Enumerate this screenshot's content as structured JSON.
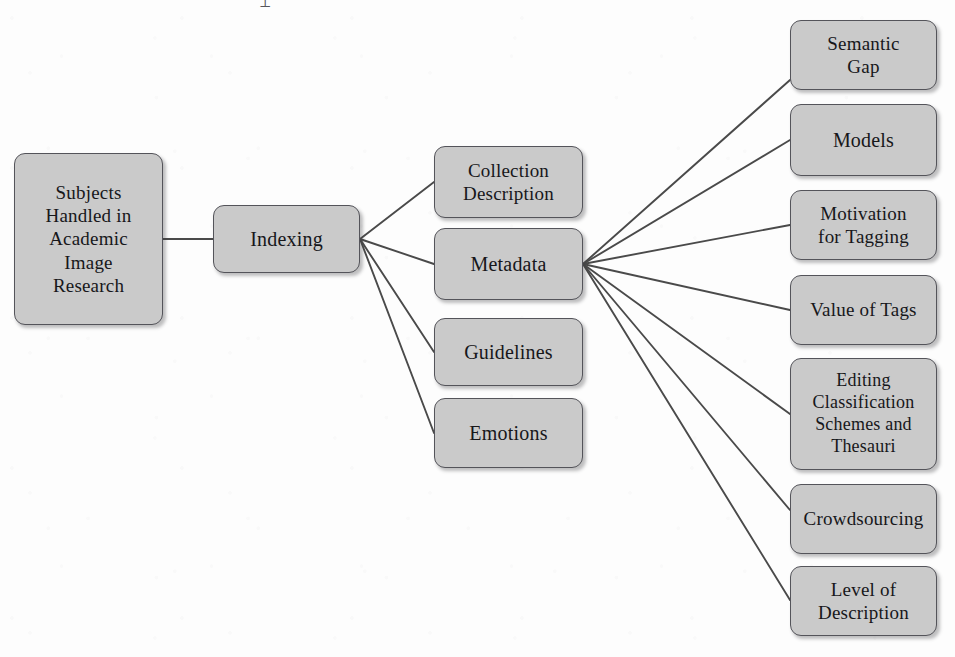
{
  "diagram": {
    "type": "tree-mindmap",
    "title": "Subjects Handled in Academic Image Research",
    "orientation": "left-to-right",
    "colors": {
      "node_fill": "#cacaca",
      "node_border": "#54545a",
      "edge": "#4a4a4a",
      "text": "#17171a",
      "background": "#fdfdfd"
    },
    "root": {
      "id": "root",
      "label": "Subjects\nHandled in\nAcademic\nImage\nResearch",
      "x": 14,
      "y": 153,
      "w": 149,
      "h": 172,
      "font_size": 19
    },
    "level1": [
      {
        "id": "indexing",
        "label": "Indexing",
        "x": 213,
        "y": 205,
        "w": 147,
        "h": 68,
        "font_size": 20
      }
    ],
    "level2": [
      {
        "id": "collection-description",
        "label": "Collection\nDescription",
        "x": 434,
        "y": 146,
        "w": 149,
        "h": 72,
        "font_size": 19
      },
      {
        "id": "metadata",
        "label": "Metadata",
        "x": 434,
        "y": 228,
        "w": 149,
        "h": 72,
        "font_size": 20
      },
      {
        "id": "guidelines",
        "label": "Guidelines",
        "x": 434,
        "y": 318,
        "w": 149,
        "h": 68,
        "font_size": 20
      },
      {
        "id": "emotions",
        "label": "Emotions",
        "x": 434,
        "y": 398,
        "w": 149,
        "h": 70,
        "font_size": 20
      }
    ],
    "level3": [
      {
        "id": "semantic-gap",
        "label": "Semantic\nGap",
        "x": 790,
        "y": 20,
        "w": 147,
        "h": 70,
        "font_size": 19
      },
      {
        "id": "models",
        "label": "Models",
        "x": 790,
        "y": 104,
        "w": 147,
        "h": 72,
        "font_size": 20
      },
      {
        "id": "motivation-for-tagging",
        "label": "Motivation\nfor Tagging",
        "x": 790,
        "y": 190,
        "w": 147,
        "h": 70,
        "font_size": 19
      },
      {
        "id": "value-of-tags",
        "label": "Value of Tags",
        "x": 790,
        "y": 275,
        "w": 147,
        "h": 70,
        "font_size": 19
      },
      {
        "id": "editing-classification-schemes-and-thesauri",
        "label": "Editing\nClassification\nSchemes and\nThesauri",
        "x": 790,
        "y": 358,
        "w": 147,
        "h": 112,
        "font_size": 18
      },
      {
        "id": "crowdsourcing",
        "label": "Crowdsourcing",
        "x": 790,
        "y": 484,
        "w": 147,
        "h": 70,
        "font_size": 19
      },
      {
        "id": "level-of-description",
        "label": "Level of\nDescription",
        "x": 790,
        "y": 566,
        "w": 147,
        "h": 70,
        "font_size": 19
      }
    ],
    "edges": [
      {
        "id": "root-indexing",
        "from": "root",
        "to": "indexing",
        "x1": 163,
        "y1": 239,
        "x2": 213,
        "y2": 239
      },
      {
        "id": "indexing-collection-description",
        "from": "indexing",
        "to": "collection-description",
        "x1": 360,
        "y1": 239,
        "x2": 434,
        "y2": 182
      },
      {
        "id": "indexing-metadata",
        "from": "indexing",
        "to": "metadata",
        "x1": 360,
        "y1": 239,
        "x2": 434,
        "y2": 264
      },
      {
        "id": "indexing-guidelines",
        "from": "indexing",
        "to": "guidelines",
        "x1": 360,
        "y1": 239,
        "x2": 434,
        "y2": 352
      },
      {
        "id": "indexing-emotions",
        "from": "indexing",
        "to": "emotions",
        "x1": 360,
        "y1": 239,
        "x2": 434,
        "y2": 433
      },
      {
        "id": "metadata-semantic-gap",
        "from": "metadata",
        "to": "semantic-gap",
        "x1": 583,
        "y1": 264,
        "x2": 790,
        "y2": 80
      },
      {
        "id": "metadata-models",
        "from": "metadata",
        "to": "models",
        "x1": 583,
        "y1": 264,
        "x2": 790,
        "y2": 140
      },
      {
        "id": "metadata-motivation-for-tagging",
        "from": "metadata",
        "to": "motivation-for-tagging",
        "x1": 583,
        "y1": 264,
        "x2": 790,
        "y2": 225
      },
      {
        "id": "metadata-value-of-tags",
        "from": "metadata",
        "to": "value-of-tags",
        "x1": 583,
        "y1": 264,
        "x2": 790,
        "y2": 310
      },
      {
        "id": "metadata-editing-classification-schemes-and-thesauri",
        "from": "metadata",
        "to": "editing-classification-schemes-and-thesauri",
        "x1": 583,
        "y1": 264,
        "x2": 790,
        "y2": 414
      },
      {
        "id": "metadata-crowdsourcing",
        "from": "metadata",
        "to": "crowdsourcing",
        "x1": 583,
        "y1": 264,
        "x2": 790,
        "y2": 510
      },
      {
        "id": "metadata-level-of-description",
        "from": "metadata",
        "to": "level-of-description",
        "x1": 583,
        "y1": 264,
        "x2": 790,
        "y2": 600
      }
    ],
    "artifacts": {
      "top_cut_text": "⊥"
    }
  }
}
